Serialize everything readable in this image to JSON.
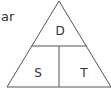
{
  "cropped_text": "ar",
  "diagram": {
    "type": "formula-triangle",
    "top_label": "D",
    "bottom_left_label": "S",
    "bottom_right_label": "T",
    "line_color": "#555555"
  }
}
